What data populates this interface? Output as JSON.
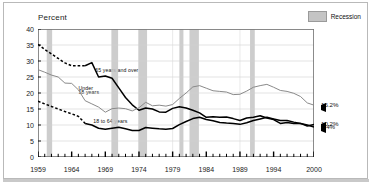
{
  "chart_data": {
    "type": "line",
    "title": "",
    "ylabel": "Percent",
    "xlabel": "",
    "ylim": [
      0,
      40
    ],
    "yticks": [
      0,
      5,
      10,
      15,
      20,
      25,
      30,
      35,
      40
    ],
    "xlim": [
      1959,
      2000
    ],
    "xticks": [
      1959,
      1964,
      1969,
      1974,
      1979,
      1984,
      1989,
      1994,
      2000
    ],
    "xtick_labels": [
      "1959",
      "1964",
      "1969",
      "1974",
      "1979",
      "1984",
      "1989",
      "1994",
      "2000"
    ],
    "grid": "horizontal",
    "legend": {
      "position": "top-right",
      "entries": [
        "Recession"
      ]
    },
    "x": [
      1959,
      1960,
      1961,
      1962,
      1963,
      1964,
      1965,
      1966,
      1967,
      1968,
      1969,
      1970,
      1971,
      1972,
      1973,
      1974,
      1975,
      1976,
      1977,
      1978,
      1979,
      1980,
      1981,
      1982,
      1983,
      1984,
      1985,
      1986,
      1987,
      1988,
      1989,
      1990,
      1991,
      1992,
      1993,
      1994,
      1995,
      1996,
      1997,
      1998,
      1999,
      2000
    ],
    "series": [
      {
        "name": "65 years and over",
        "color": "#000000",
        "end_value": 10.2,
        "dashed_before": 1966,
        "values": [
          35.2,
          33.6,
          32.2,
          30.8,
          29.4,
          28.5,
          28.5,
          28.5,
          29.5,
          25.0,
          25.3,
          24.6,
          21.6,
          18.6,
          16.3,
          14.6,
          15.3,
          15.0,
          14.1,
          14.0,
          15.2,
          15.7,
          15.3,
          14.6,
          13.8,
          12.4,
          12.6,
          12.4,
          12.5,
          12.0,
          11.4,
          12.2,
          12.4,
          12.9,
          12.2,
          11.7,
          10.5,
          10.8,
          10.5,
          10.5,
          9.7,
          10.2
        ]
      },
      {
        "name": "Under 18 years",
        "color": "#8a8a8a",
        "end_value": 16.2,
        "values": [
          27.3,
          26.5,
          25.6,
          25.0,
          23.1,
          23.0,
          21.0,
          17.6,
          16.6,
          15.6,
          14.0,
          15.1,
          15.3,
          15.1,
          14.4,
          15.4,
          17.1,
          16.0,
          16.2,
          15.9,
          16.4,
          18.3,
          20.0,
          21.9,
          22.3,
          21.5,
          20.7,
          20.5,
          20.3,
          19.5,
          19.6,
          20.6,
          21.8,
          22.3,
          22.7,
          21.8,
          20.8,
          20.5,
          19.9,
          18.9,
          16.9,
          16.2
        ]
      },
      {
        "name": "18 to 64 years",
        "color": "#000000",
        "end_value": 9.4,
        "dashed_before": 1966,
        "values": [
          17.4,
          16.6,
          15.8,
          15.0,
          14.2,
          13.5,
          12.7,
          10.5,
          10.0,
          9.0,
          8.7,
          9.0,
          9.3,
          8.8,
          8.3,
          8.3,
          9.2,
          9.0,
          8.8,
          8.7,
          8.9,
          10.1,
          11.1,
          12.0,
          12.4,
          11.7,
          11.3,
          10.8,
          10.6,
          10.5,
          10.2,
          10.7,
          11.4,
          11.9,
          12.4,
          11.9,
          11.4,
          11.4,
          10.9,
          10.5,
          10.0,
          9.4
        ]
      }
    ],
    "recessions": [
      {
        "start": 1960.3,
        "end": 1961.1
      },
      {
        "start": 1969.9,
        "end": 1970.9
      },
      {
        "start": 1973.9,
        "end": 1975.2
      },
      {
        "start": 1980.0,
        "end": 1980.6
      },
      {
        "start": 1981.5,
        "end": 1982.9
      },
      {
        "start": 1990.5,
        "end": 1991.2
      }
    ],
    "annotations": [
      {
        "text": "65 years and over",
        "x": 1967.5,
        "y": 27.2
      },
      {
        "text": "Under",
        "x": 1965.0,
        "y": 21.6
      },
      {
        "text": "18 years",
        "x": 1965.0,
        "y": 20.2
      },
      {
        "text": "18 to 64 years",
        "x": 1967.2,
        "y": 11.4
      }
    ],
    "end_labels": [
      {
        "text": "16.2%",
        "value": 16.2
      },
      {
        "text": "10.2%",
        "value": 10.2
      },
      {
        "text": "9.4%",
        "value": 9.4
      }
    ]
  },
  "legend": {
    "recession_label": "Recession"
  },
  "axis": {
    "y_title": "Percent",
    "y_ticks": [
      "40",
      "35",
      "30",
      "25",
      "20",
      "15",
      "10",
      "5",
      "0"
    ],
    "x_ticks": [
      "1959",
      "1964",
      "1969",
      "1974",
      "1979",
      "1984",
      "1989",
      "1994",
      "2000"
    ]
  },
  "series_labels": {
    "over65": "65 years and over",
    "under18_line1": "Under",
    "under18_line2": "18 years",
    "adults_18_64": "18 to 64 years"
  },
  "end_labels": {
    "under18": "16.2%",
    "over65": "10.2%",
    "adults": "9.4%"
  },
  "colors": {
    "line_dark": "#000000",
    "line_gray": "#8a8a8a",
    "recession_band": "#c4c4c4",
    "grid": "#d0d0d0",
    "frame": "#b9b9b9"
  }
}
